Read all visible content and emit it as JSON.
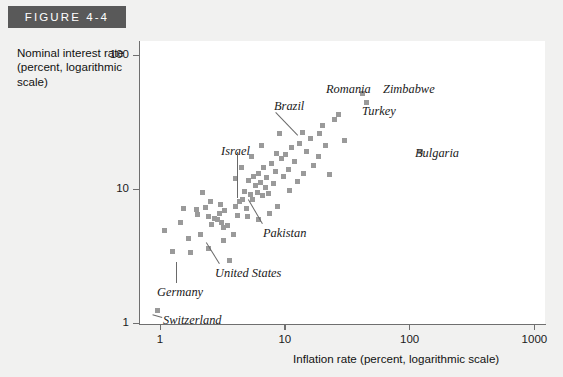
{
  "figure": {
    "banner_label": "FIGURE 4-4"
  },
  "chart_data": {
    "type": "scatter",
    "title": "FIGURE 4-4",
    "xlabel": "Inflation rate (percent, logarithmic scale)",
    "ylabel": "Nominal interest rate (percent, logarithmic scale)",
    "xscale": "log",
    "yscale": "log",
    "xlim": [
      0.8,
      1400
    ],
    "ylim": [
      0.9,
      160
    ],
    "xticks": [
      "1",
      "10",
      "100",
      "1000"
    ],
    "xtick_values": [
      1,
      10,
      100,
      1000
    ],
    "yticks": [
      "1",
      "10",
      "100"
    ],
    "ytick_values": [
      1,
      10,
      100
    ],
    "grid": false,
    "legend": "none",
    "marker_color": "#9a9a9a",
    "marker_shape": "square",
    "annotations": [
      {
        "label": "Romania",
        "x": 42,
        "y": 52
      },
      {
        "label": "Zimbabwe",
        "x": 42,
        "y": 52
      },
      {
        "label": "Turkey",
        "x": 45,
        "y": 44
      },
      {
        "label": "Brazil",
        "x": 9.0,
        "y": 26
      },
      {
        "label": "Bulgaria",
        "x": 122,
        "y": 19
      },
      {
        "label": "Israel",
        "x": 4.6,
        "y": 8.3
      },
      {
        "label": "Pakistan",
        "x": 7.4,
        "y": 9.2
      },
      {
        "label": "United States",
        "x": 3.1,
        "y": 5.6
      },
      {
        "label": "Germany",
        "x": 1.7,
        "y": 4.3
      },
      {
        "label": "Switzerland",
        "x": 0.95,
        "y": 1.25
      }
    ],
    "points": [
      {
        "x": 0.95,
        "y": 1.25
      },
      {
        "x": 1.25,
        "y": 3.4
      },
      {
        "x": 1.45,
        "y": 5.6
      },
      {
        "x": 1.7,
        "y": 4.3
      },
      {
        "x": 1.75,
        "y": 3.35
      },
      {
        "x": 1.08,
        "y": 4.9
      },
      {
        "x": 2.0,
        "y": 6.4
      },
      {
        "x": 2.1,
        "y": 4.6
      },
      {
        "x": 2.3,
        "y": 7.3
      },
      {
        "x": 2.45,
        "y": 6.2
      },
      {
        "x": 2.6,
        "y": 5.4
      },
      {
        "x": 2.75,
        "y": 6.0
      },
      {
        "x": 2.9,
        "y": 5.9
      },
      {
        "x": 3.0,
        "y": 6.6
      },
      {
        "x": 3.1,
        "y": 5.6
      },
      {
        "x": 3.2,
        "y": 5.15
      },
      {
        "x": 3.3,
        "y": 6.9
      },
      {
        "x": 3.45,
        "y": 5.3
      },
      {
        "x": 3.6,
        "y": 2.95
      },
      {
        "x": 3.2,
        "y": 4.1
      },
      {
        "x": 2.45,
        "y": 3.6
      },
      {
        "x": 3.05,
        "y": 7.6
      },
      {
        "x": 1.55,
        "y": 7.1
      },
      {
        "x": 1.95,
        "y": 7.0
      },
      {
        "x": 4.0,
        "y": 7.4
      },
      {
        "x": 4.2,
        "y": 6.3
      },
      {
        "x": 4.35,
        "y": 8.0
      },
      {
        "x": 4.6,
        "y": 8.3
      },
      {
        "x": 4.75,
        "y": 9.6
      },
      {
        "x": 4.9,
        "y": 7.1
      },
      {
        "x": 5.1,
        "y": 11.5
      },
      {
        "x": 5.3,
        "y": 9.1
      },
      {
        "x": 5.5,
        "y": 8.4
      },
      {
        "x": 5.6,
        "y": 12.4
      },
      {
        "x": 5.8,
        "y": 10.6
      },
      {
        "x": 6.0,
        "y": 9.4
      },
      {
        "x": 6.2,
        "y": 13.0
      },
      {
        "x": 6.4,
        "y": 11.2
      },
      {
        "x": 6.6,
        "y": 8.9
      },
      {
        "x": 6.8,
        "y": 14.5
      },
      {
        "x": 7.0,
        "y": 10.3
      },
      {
        "x": 7.2,
        "y": 12.1
      },
      {
        "x": 7.4,
        "y": 9.2
      },
      {
        "x": 7.8,
        "y": 15.6
      },
      {
        "x": 8.1,
        "y": 11.0
      },
      {
        "x": 8.4,
        "y": 13.4
      },
      {
        "x": 8.8,
        "y": 7.4
      },
      {
        "x": 9.0,
        "y": 26.0
      },
      {
        "x": 9.4,
        "y": 16.8
      },
      {
        "x": 9.8,
        "y": 12.3
      },
      {
        "x": 10.2,
        "y": 18.0
      },
      {
        "x": 10.8,
        "y": 14.0
      },
      {
        "x": 11.4,
        "y": 20.5
      },
      {
        "x": 12.0,
        "y": 16.0
      },
      {
        "x": 12.6,
        "y": 11.4
      },
      {
        "x": 13.2,
        "y": 22.0
      },
      {
        "x": 14.0,
        "y": 13.0
      },
      {
        "x": 15.0,
        "y": 19.0
      },
      {
        "x": 16.0,
        "y": 24.0
      },
      {
        "x": 17.0,
        "y": 15.0
      },
      {
        "x": 18.5,
        "y": 17.5
      },
      {
        "x": 20.0,
        "y": 30.0
      },
      {
        "x": 21.0,
        "y": 21.0
      },
      {
        "x": 23.0,
        "y": 12.8
      },
      {
        "x": 25.0,
        "y": 33.0
      },
      {
        "x": 27.0,
        "y": 36.0
      },
      {
        "x": 30.0,
        "y": 23.0
      },
      {
        "x": 42.0,
        "y": 52.0
      },
      {
        "x": 45.0,
        "y": 44.0
      },
      {
        "x": 122.0,
        "y": 19.0
      },
      {
        "x": 4.05,
        "y": 12.0
      },
      {
        "x": 2.2,
        "y": 9.4
      },
      {
        "x": 5.0,
        "y": 6.2
      },
      {
        "x": 6.1,
        "y": 5.9
      },
      {
        "x": 7.6,
        "y": 6.6
      },
      {
        "x": 3.9,
        "y": 4.6
      },
      {
        "x": 8.6,
        "y": 18.5
      },
      {
        "x": 11.0,
        "y": 9.7
      },
      {
        "x": 13.8,
        "y": 26.5
      },
      {
        "x": 19.0,
        "y": 26.0
      },
      {
        "x": 6.5,
        "y": 21.0
      },
      {
        "x": 5.45,
        "y": 17.5
      },
      {
        "x": 4.5,
        "y": 14.5
      },
      {
        "x": 2.55,
        "y": 8.1
      }
    ]
  }
}
